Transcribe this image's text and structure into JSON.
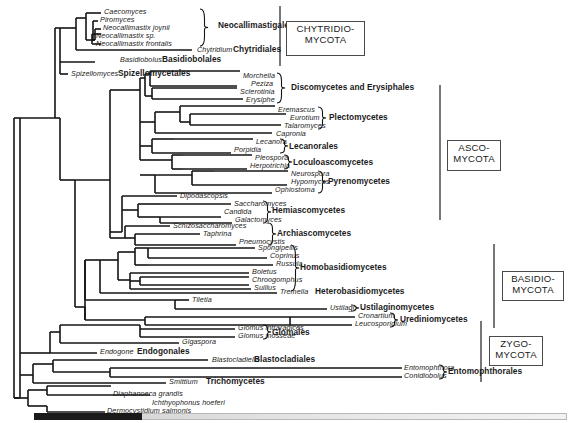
{
  "figure": {
    "type": "phylogenetic-cladogram"
  },
  "taxa": [
    {
      "name": "Caecomyces",
      "x": 104,
      "y": 12
    },
    {
      "name": "Piromyces",
      "x": 100,
      "y": 20
    },
    {
      "name": "Neocallimastix joynii",
      "x": 103,
      "y": 28
    },
    {
      "name": "Neocallimastix sp.",
      "x": 96,
      "y": 36
    },
    {
      "name": "Neocallimastix frontalis",
      "x": 96,
      "y": 44
    },
    {
      "name": "Chytridium",
      "x": 197,
      "y": 50
    },
    {
      "name": "Basidiobolus",
      "x": 120,
      "y": 60
    },
    {
      "name": "Spizellomyces",
      "x": 71,
      "y": 74
    },
    {
      "name": "Morchella",
      "x": 243,
      "y": 76
    },
    {
      "name": "Peziza",
      "x": 251,
      "y": 84
    },
    {
      "name": "Sclerotinia",
      "x": 240,
      "y": 92
    },
    {
      "name": "Erysiphe",
      "x": 246,
      "y": 100
    },
    {
      "name": "Eremascus",
      "x": 278,
      "y": 110
    },
    {
      "name": "Eurotium",
      "x": 290,
      "y": 118
    },
    {
      "name": "Talaromyces",
      "x": 284,
      "y": 126
    },
    {
      "name": "Capronia",
      "x": 276,
      "y": 134
    },
    {
      "name": "Lecanora",
      "x": 256,
      "y": 142
    },
    {
      "name": "Porpidia",
      "x": 234,
      "y": 150
    },
    {
      "name": "Pleospora",
      "x": 255,
      "y": 158
    },
    {
      "name": "Herpotrichia",
      "x": 250,
      "y": 166
    },
    {
      "name": "Neurospora",
      "x": 291,
      "y": 174
    },
    {
      "name": "Hypomyces",
      "x": 291,
      "y": 182
    },
    {
      "name": "Ophiostoma",
      "x": 275,
      "y": 190
    },
    {
      "name": "Dipodascopsis",
      "x": 180,
      "y": 196
    },
    {
      "name": "Saccharomyces",
      "x": 234,
      "y": 204
    },
    {
      "name": "Candida",
      "x": 224,
      "y": 212
    },
    {
      "name": "Galactomyces",
      "x": 235,
      "y": 220
    },
    {
      "name": "Schizosaccharomyces",
      "x": 173,
      "y": 226
    },
    {
      "name": "Taphrina",
      "x": 203,
      "y": 234
    },
    {
      "name": "Pneumocystis",
      "x": 239,
      "y": 242
    },
    {
      "name": "Spongipellis",
      "x": 258,
      "y": 248
    },
    {
      "name": "Coprinus",
      "x": 270,
      "y": 256
    },
    {
      "name": "Russula",
      "x": 276,
      "y": 264
    },
    {
      "name": "Boletus",
      "x": 252,
      "y": 272
    },
    {
      "name": "Chroogomphus",
      "x": 252,
      "y": 280
    },
    {
      "name": "Suillus",
      "x": 254,
      "y": 288
    },
    {
      "name": "Tremella",
      "x": 280,
      "y": 292
    },
    {
      "name": "Tiletia",
      "x": 192,
      "y": 300
    },
    {
      "name": "Ustilago",
      "x": 330,
      "y": 308
    },
    {
      "name": "Cronartium",
      "x": 358,
      "y": 316
    },
    {
      "name": "Leucosporidium",
      "x": 355,
      "y": 324
    },
    {
      "name": "Glomus intraradices",
      "x": 238,
      "y": 328
    },
    {
      "name": "Glomus mosseae",
      "x": 238,
      "y": 336
    },
    {
      "name": "Gigaspora",
      "x": 182,
      "y": 342
    },
    {
      "name": "Endogone",
      "x": 100,
      "y": 352
    },
    {
      "name": "Blastocladiella",
      "x": 212,
      "y": 360
    },
    {
      "name": "Entomophthora",
      "x": 404,
      "y": 368
    },
    {
      "name": "Conidiobolus",
      "x": 404,
      "y": 376
    },
    {
      "name": "Smittium",
      "x": 169,
      "y": 382
    },
    {
      "name": "Diaphanoeca grandis",
      "x": 113,
      "y": 394
    },
    {
      "name": "Ichthyophonus hoeferi",
      "x": 152,
      "y": 403
    },
    {
      "name": "Dermocystidium salmonis",
      "x": 107,
      "y": 411
    }
  ],
  "groups": [
    {
      "name": "Neocallimastigales",
      "x": 218,
      "y": 25
    },
    {
      "name": "Chytridiales",
      "x": 233,
      "y": 49
    },
    {
      "name": "Basidiobolales",
      "x": 162,
      "y": 59
    },
    {
      "name": "Spizellomycetales",
      "x": 118,
      "y": 73
    },
    {
      "name": "Discomycetes and Erysiphales",
      "x": 291,
      "y": 87
    },
    {
      "name": "Plectomycetes",
      "x": 329,
      "y": 117
    },
    {
      "name": "Lecanorales",
      "x": 289,
      "y": 146
    },
    {
      "name": "Loculoascomycetes",
      "x": 293,
      "y": 162
    },
    {
      "name": "Pyrenomycetes",
      "x": 328,
      "y": 181
    },
    {
      "name": "Hemiascomycetes",
      "x": 272,
      "y": 210
    },
    {
      "name": "Archiascomycetes",
      "x": 277,
      "y": 233
    },
    {
      "name": "Homobasidiomycetes",
      "x": 300,
      "y": 267
    },
    {
      "name": "Heterobasidiomycetes",
      "x": 315,
      "y": 291
    },
    {
      "name": "Ustilaginomycetes",
      "x": 360,
      "y": 307
    },
    {
      "name": "Urediniomycetes",
      "x": 400,
      "y": 319
    },
    {
      "name": "Glomales",
      "x": 272,
      "y": 332
    },
    {
      "name": "Endogonales",
      "x": 137,
      "y": 351
    },
    {
      "name": "Blastocladiales",
      "x": 254,
      "y": 359
    },
    {
      "name": "Entomophthorales",
      "x": 448,
      "y": 371
    },
    {
      "name": "Trichomycetes",
      "x": 206,
      "y": 381
    }
  ],
  "phyla": [
    {
      "lines": [
        "CHYTRIDIO-",
        "MYCOTA"
      ],
      "x": 286,
      "y": 21,
      "w": 79,
      "h": 35
    },
    {
      "lines": [
        "ASCO-",
        "MYCOTA"
      ],
      "x": 447,
      "y": 140,
      "w": 54,
      "h": 31
    },
    {
      "lines": [
        "BASIDIO-",
        "MYCOTA"
      ],
      "x": 502,
      "y": 271,
      "w": 62,
      "h": 30
    },
    {
      "lines": [
        "ZYGO-",
        "MYCOTA"
      ],
      "x": 489,
      "y": 336,
      "w": 54,
      "h": 30
    }
  ],
  "phylum_brackets": [
    {
      "x": 280,
      "y1": 6,
      "y2": 66
    },
    {
      "x": 440,
      "y1": 85,
      "y2": 220
    },
    {
      "x": 494,
      "y1": 244,
      "y2": 328
    },
    {
      "x": 481,
      "y1": 321,
      "y2": 382
    }
  ],
  "braces": [
    {
      "x": 200,
      "y1": 9,
      "y2": 46,
      "label": "Neocallimastigales"
    },
    {
      "x": 277,
      "y1": 73,
      "y2": 103,
      "label": "Discomycetes and Erysiphales"
    },
    {
      "x": 318,
      "y1": 107,
      "y2": 129,
      "label": "Plectomycetes"
    },
    {
      "x": 280,
      "y1": 139,
      "y2": 153,
      "label": "Lecanorales"
    },
    {
      "x": 284,
      "y1": 155,
      "y2": 169,
      "label": "Loculoascomycetes"
    },
    {
      "x": 318,
      "y1": 171,
      "y2": 193,
      "label": "Pyrenomycetes"
    },
    {
      "x": 263,
      "y1": 201,
      "y2": 223,
      "label": "Hemiascomycetes"
    },
    {
      "x": 268,
      "y1": 223,
      "y2": 245,
      "label": "Archiascomycetes"
    },
    {
      "x": 291,
      "y1": 245,
      "y2": 291,
      "label": "Homobasidiomycetes"
    },
    {
      "x": 351,
      "y1": 305,
      "y2": 311,
      "label": "Ustilaginomycetes"
    },
    {
      "x": 390,
      "y1": 313,
      "y2": 327,
      "label": "Urediniomycetes"
    },
    {
      "x": 263,
      "y1": 325,
      "y2": 339,
      "label": "Glomales"
    },
    {
      "x": 439,
      "y1": 365,
      "y2": 379,
      "label": "Entomophthorales"
    }
  ],
  "chart_data": {
    "type": "cladogram",
    "tip_count": 52,
    "phyla": [
      "CHYTRIDIOMYCOTA",
      "ASCOMYCOTA",
      "BASIDIOMYCOTA",
      "ZYGOMYCOTA"
    ],
    "orders_and_classes": [
      "Neocallimastigales",
      "Chytridiales",
      "Basidiobolales",
      "Spizellomycetales",
      "Discomycetes and Erysiphales",
      "Plectomycetes",
      "Lecanorales",
      "Loculoascomycetes",
      "Pyrenomycetes",
      "Hemiascomycetes",
      "Archiascomycetes",
      "Homobasidiomycetes",
      "Heterobasidiomycetes",
      "Ustilaginomycetes",
      "Urediniomycetes",
      "Glomales",
      "Endogonales",
      "Blastocladiales",
      "Entomophthorales",
      "Trichomycetes"
    ],
    "outgroup_taxa": [
      "Diaphanoeca grandis",
      "Ichthyophonus hoeferi",
      "Dermocystidium salmonis"
    ],
    "grid": false,
    "legend": "none"
  },
  "scrollbar": {
    "track_label": "horizontal-scroll-track",
    "thumb_label": "horizontal-scroll-thumb"
  }
}
